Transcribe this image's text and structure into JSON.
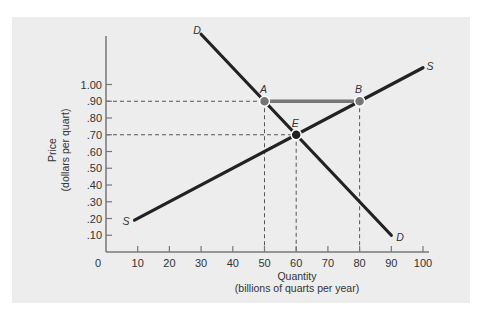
{
  "chart_data": {
    "type": "line",
    "title": "",
    "xlabel": "Quantity",
    "xlabel_sub": "(billions of quarts per year)",
    "ylabel": "Price",
    "ylabel_sub": "(dollars per quart)",
    "xlim": [
      0,
      100
    ],
    "ylim": [
      0,
      1.0
    ],
    "x_ticks": [
      0,
      10,
      20,
      30,
      40,
      50,
      60,
      70,
      80,
      90,
      100
    ],
    "x_tick_labels": [
      "0",
      "10",
      "20",
      "30",
      "40",
      "50",
      "60",
      "70",
      "80",
      "90",
      "100"
    ],
    "y_ticks": [
      0.1,
      0.2,
      0.3,
      0.4,
      0.5,
      0.6,
      0.7,
      0.8,
      0.9,
      1.0
    ],
    "y_tick_labels": [
      ".10",
      ".20",
      ".30",
      ".40",
      ".50",
      ".60",
      ".70",
      ".80",
      ".90",
      "1.00"
    ],
    "grid": false,
    "series": [
      {
        "name": "D",
        "label": "Demand",
        "points": [
          [
            30,
            1.3
          ],
          [
            90,
            0.1
          ]
        ],
        "color": "#222222"
      },
      {
        "name": "S",
        "label": "Supply",
        "points": [
          [
            9,
            0.19
          ],
          [
            100,
            1.1
          ]
        ],
        "color": "#222222"
      }
    ],
    "points": [
      {
        "label": "A",
        "x": 50,
        "y": 0.9,
        "fill": "#777777"
      },
      {
        "label": "B",
        "x": 80,
        "y": 0.9,
        "fill": "#777777"
      },
      {
        "label": "E",
        "x": 60,
        "y": 0.7,
        "fill": "#222222"
      }
    ],
    "segments": [
      {
        "from": "A",
        "to": "B",
        "color": "#777777",
        "description": "Excess supply at price .90"
      }
    ],
    "reference_lines": [
      {
        "type": "horizontal",
        "y": 0.9,
        "x_to": 80,
        "style": "dashed"
      },
      {
        "type": "horizontal",
        "y": 0.7,
        "x_to": 60,
        "style": "dashed"
      },
      {
        "type": "vertical",
        "x": 50,
        "y_to": 0.9,
        "style": "dashed"
      },
      {
        "type": "vertical",
        "x": 60,
        "y_to": 0.7,
        "style": "dashed"
      },
      {
        "type": "vertical",
        "x": 80,
        "y_to": 0.9,
        "style": "dashed"
      }
    ],
    "curve_labels": {
      "demand_top": "D",
      "demand_bottom": "D",
      "supply_top": "S",
      "supply_bottom": "S"
    }
  }
}
